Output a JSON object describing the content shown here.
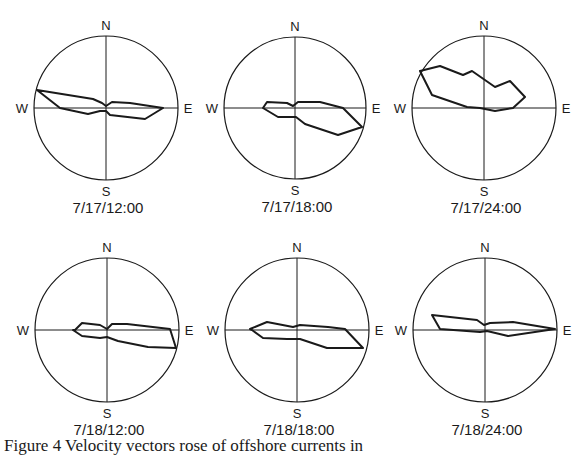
{
  "figure": {
    "caption": "Figure 4 Velocity vectors rose of offshore currents in"
  },
  "axis_labels": {
    "north": "N",
    "south": "S",
    "east": "E",
    "west": "W"
  },
  "style": {
    "line_color": "#1a1a1a",
    "background": "#ffffff"
  },
  "chart_data": [
    {
      "type": "polar-rose",
      "title": "7/17/12:00",
      "center": [
        106,
        108
      ],
      "radius": 72,
      "directions": [
        "N",
        "E",
        "S",
        "W"
      ],
      "polygon": [
        [
          37,
          90
        ],
        [
          93,
          99
        ],
        [
          102,
          103
        ],
        [
          106,
          106
        ],
        [
          112,
          102
        ],
        [
          130,
          103
        ],
        [
          163,
          108
        ],
        [
          145,
          119
        ],
        [
          110,
          115
        ],
        [
          106,
          111
        ],
        [
          100,
          111
        ],
        [
          88,
          114
        ],
        [
          60,
          108
        ]
      ]
    },
    {
      "type": "polar-rose",
      "title": "7/17/18:00",
      "center": [
        295,
        108
      ],
      "radius": 71,
      "directions": [
        "N",
        "E",
        "S",
        "W"
      ],
      "polygon": [
        [
          267,
          102
        ],
        [
          287,
          103
        ],
        [
          293,
          106
        ],
        [
          298,
          102
        ],
        [
          320,
          102
        ],
        [
          343,
          108
        ],
        [
          362,
          127
        ],
        [
          338,
          135
        ],
        [
          305,
          124
        ],
        [
          296,
          117
        ],
        [
          290,
          117
        ],
        [
          278,
          117
        ],
        [
          263,
          108
        ]
      ]
    },
    {
      "type": "polar-rose",
      "title": "7/17/24:00",
      "center": [
        484,
        108
      ],
      "radius": 72,
      "directions": [
        "N",
        "E",
        "S",
        "W"
      ],
      "polygon": [
        [
          420,
          71
        ],
        [
          440,
          66
        ],
        [
          463,
          75
        ],
        [
          472,
          71
        ],
        [
          495,
          87
        ],
        [
          510,
          81
        ],
        [
          525,
          97
        ],
        [
          513,
          108
        ],
        [
          495,
          111
        ],
        [
          480,
          108
        ],
        [
          467,
          107
        ],
        [
          432,
          95
        ]
      ]
    },
    {
      "type": "polar-rose",
      "title": "7/18/12:00",
      "center": [
        107,
        330
      ],
      "radius": 72,
      "directions": [
        "N",
        "E",
        "S",
        "W"
      ],
      "polygon": [
        [
          75,
          330
        ],
        [
          82,
          323
        ],
        [
          100,
          325
        ],
        [
          107,
          329
        ],
        [
          112,
          324
        ],
        [
          127,
          324
        ],
        [
          170,
          329
        ],
        [
          176,
          348
        ],
        [
          148,
          347
        ],
        [
          118,
          341
        ],
        [
          107,
          337
        ],
        [
          100,
          338
        ],
        [
          82,
          336
        ],
        [
          73,
          330
        ]
      ]
    },
    {
      "type": "polar-rose",
      "title": "7/18/18:00",
      "center": [
        297,
        330
      ],
      "radius": 72,
      "directions": [
        "N",
        "E",
        "S",
        "W"
      ],
      "polygon": [
        [
          250,
          329
        ],
        [
          267,
          322
        ],
        [
          293,
          327
        ],
        [
          300,
          325
        ],
        [
          328,
          327
        ],
        [
          345,
          329
        ],
        [
          363,
          348
        ],
        [
          327,
          348
        ],
        [
          300,
          339
        ],
        [
          287,
          339
        ],
        [
          263,
          338
        ],
        [
          252,
          330
        ]
      ]
    },
    {
      "type": "polar-rose",
      "title": "7/18/24:00",
      "center": [
        485,
        330
      ],
      "radius": 72,
      "directions": [
        "N",
        "E",
        "S",
        "W"
      ],
      "polygon": [
        [
          432,
          315
        ],
        [
          477,
          320
        ],
        [
          484,
          325
        ],
        [
          490,
          323
        ],
        [
          513,
          322
        ],
        [
          555,
          329
        ],
        [
          508,
          336
        ],
        [
          487,
          331
        ],
        [
          480,
          332
        ],
        [
          440,
          329
        ]
      ]
    }
  ]
}
